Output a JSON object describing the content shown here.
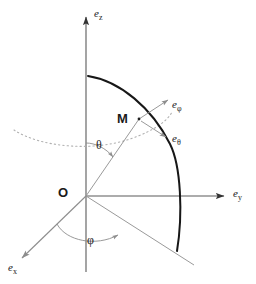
{
  "figure": {
    "background_color": "#ffffff",
    "axis_color": "#555555",
    "arc_color": "#1a1a1a",
    "parallel_color": "#aaaaaa",
    "ray_color": "#999999",
    "text_color": "#1a1a1a"
  },
  "axes": [
    {
      "id": "z",
      "label_base": "e",
      "label_sub": "z",
      "direction": "up",
      "label_x": 94,
      "label_y": 8
    },
    {
      "id": "y",
      "label_base": "e",
      "label_sub": "y",
      "direction": "right",
      "label_x": 233,
      "label_y": 188
    },
    {
      "id": "x",
      "label_base": "e",
      "label_sub": "x",
      "direction": "down-left",
      "label_x": 8,
      "label_y": 262
    }
  ],
  "points": [
    {
      "id": "origin",
      "label": "O",
      "label_x": 58,
      "label_y": 186
    },
    {
      "id": "point-m",
      "label": "M",
      "label_x": 117,
      "label_y": 113
    }
  ],
  "angles": [
    {
      "id": "theta",
      "label": "θ",
      "label_x": 96,
      "label_y": 140,
      "description": "polar angle from z-axis"
    },
    {
      "id": "phi",
      "label": "φ",
      "label_x": 87,
      "label_y": 235,
      "description": "azimuthal angle in xy-plane"
    }
  ],
  "unit_vectors": [
    {
      "id": "e-phi",
      "label_base": "e",
      "label_sub": "φ",
      "label_x": 172,
      "label_y": 101,
      "direction": "up-right"
    },
    {
      "id": "e-theta",
      "label_base": "e",
      "label_sub": "θ",
      "label_x": 172,
      "label_y": 134,
      "direction": "down-right"
    }
  ],
  "curves": [
    {
      "id": "meridian-arc",
      "style": "solid-thick-black",
      "description": "meridian great-circle arc from z-axis through M to xy-plane"
    },
    {
      "id": "parallel-circle",
      "style": "dotted-gray",
      "description": "parallel (latitude) circle through M"
    },
    {
      "id": "radius-om",
      "style": "solid-thin-gray",
      "description": "radius from O to M"
    },
    {
      "id": "projection-ray",
      "style": "solid-thin-gray",
      "description": "projection of OM onto the xy-plane"
    }
  ]
}
